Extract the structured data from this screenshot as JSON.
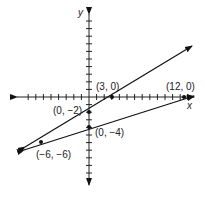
{
  "chart_data": {
    "type": "line",
    "title": "",
    "xlabel": "x",
    "ylabel": "y",
    "grid": false,
    "series": [
      {
        "name": "line through (-6,-6), (0,-2), (3,0)",
        "points": [
          [
            -6,
            -6
          ],
          [
            0,
            -2
          ],
          [
            3,
            0
          ]
        ],
        "slope": 0.6667,
        "intercept": -2
      },
      {
        "name": "line through (-6,-6), (0,-4), (12,0)",
        "points": [
          [
            -6,
            -6
          ],
          [
            0,
            -4
          ],
          [
            12,
            0
          ]
        ],
        "slope": 0.3333,
        "intercept": -4
      }
    ],
    "annotations": [
      "(3, 0)",
      "(12, 0)",
      "(0, −2)",
      "(0, −4)",
      "(−6, −6)"
    ],
    "xlim": [
      -8,
      13
    ],
    "ylim": [
      -10,
      9
    ]
  },
  "labels": {
    "x_axis": "x",
    "y_axis": "y",
    "p1": "(3, 0)",
    "p2": "(12, 0)",
    "p3": "(0, −2)",
    "p4": "(0, −4)",
    "p5": "(−6, −6)"
  }
}
